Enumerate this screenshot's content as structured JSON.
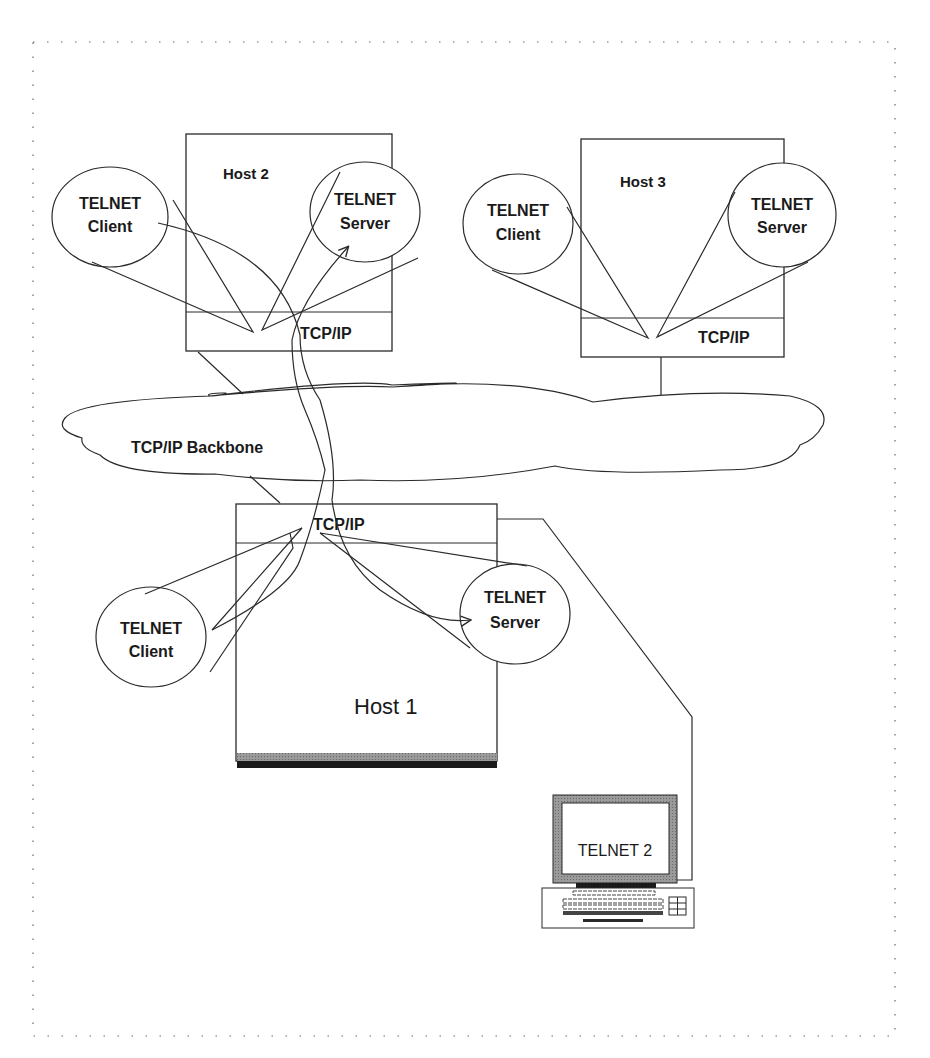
{
  "diagram": {
    "type": "network-architecture",
    "backbone": {
      "label": "TCP/IP Backbone"
    },
    "hosts": [
      {
        "id": "host2",
        "label": "Host 2",
        "stack_label": "TCP/IP",
        "client_label": [
          "TELNET",
          "Client"
        ],
        "server_label": [
          "TELNET",
          "Server"
        ]
      },
      {
        "id": "host3",
        "label": "Host 3",
        "stack_label": "TCP/IP",
        "client_label": [
          "TELNET",
          "Client"
        ],
        "server_label": [
          "TELNET",
          "Server"
        ]
      },
      {
        "id": "host1",
        "label": "Host 1",
        "stack_label": "TCP/IP",
        "client_label": [
          "TELNET",
          "Client"
        ],
        "server_label": [
          "TELNET",
          "Server"
        ]
      }
    ],
    "terminal": {
      "label": "TELNET 2"
    },
    "connections": [
      {
        "from": "host2.client",
        "to": "host1.server",
        "via": "TCP/IP Backbone",
        "arrow": true
      },
      {
        "from": "host1.client",
        "to": "host2.server",
        "via": "TCP/IP Backbone",
        "arrow": true
      },
      {
        "from": "terminal",
        "to": "host1",
        "arrow": false
      }
    ]
  }
}
